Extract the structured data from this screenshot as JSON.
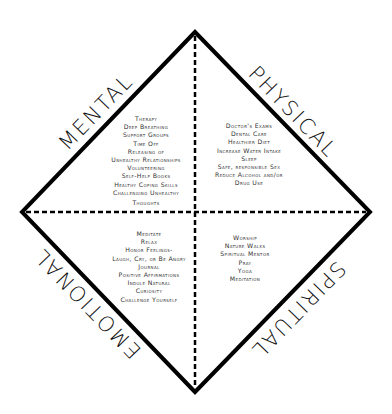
{
  "diagram": {
    "type": "four-quadrant wellness diamond",
    "quadrants": {
      "mental": {
        "label": "MENTAL",
        "items": [
          "Therapy",
          "Deep Breathing",
          "Support Groups",
          "Time Off",
          "Releasing of",
          "Unhealthy Relationships",
          "Volunteering",
          "Self-Help Books",
          "Healthy Coping Skills",
          "Challenging Unhealthy",
          "Thoughts"
        ]
      },
      "physical": {
        "label": "PHYSICAL",
        "items": [
          "Doctor's Exams",
          "Dental Care",
          "Healthier Diet",
          "Increase Water Intake",
          "Sleep",
          "Safe, responsible Sex",
          "Reduce Alcohol and/or",
          "Drug Use"
        ]
      },
      "emotional": {
        "label": "EMOTIONAL",
        "items": [
          "Meditate",
          "Relax",
          "Honor Feelings-",
          "Laugh, Cry, or Be Angry",
          "Journal",
          "Positive Affirmations",
          "Indule Natural",
          "Curiosity",
          "Challenge Yourself"
        ]
      },
      "spiritual": {
        "label": "SPIRITUAL",
        "items": [
          "Worship",
          "Nature Walks",
          "Spiritual Mentor",
          "Pray",
          "Yoga",
          "Meditation"
        ]
      }
    },
    "colors": {
      "outline": "#000000",
      "text": "#333333",
      "background": "#ffffff"
    }
  }
}
